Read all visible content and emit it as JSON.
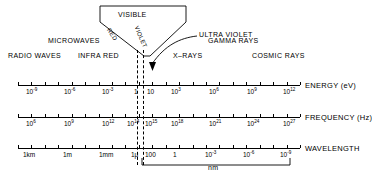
{
  "figure": {
    "visible_funnel": {
      "label": "VISIBLE",
      "left_edge_label": "RED",
      "right_edge_label": "VIOLET"
    },
    "callout": {
      "label": "ULTRA VIOLET",
      "arrow": "curved-arrow-down"
    },
    "bands_upper": [
      {
        "label": "MICROWAVES",
        "x": 87,
        "y": 40
      },
      {
        "label": "GAMMA RAYS",
        "x": 244,
        "y": 40
      }
    ],
    "bands_lower": [
      {
        "label": "RADIO WAVES",
        "x": 35,
        "y": 56
      },
      {
        "label": "INFRA RED",
        "x": 103,
        "y": 56
      },
      {
        "label": "X–RAYS",
        "x": 190,
        "y": 56
      },
      {
        "label": "COSMIC RAYS",
        "x": 280,
        "y": 56
      }
    ],
    "bracket": {
      "label": "nm",
      "from_x": 142,
      "to_x": 290
    },
    "dashed_lines_x": [
      137,
      143
    ],
    "axes": [
      {
        "name": "ENERGY  (eV)",
        "short": "energy",
        "y": 85,
        "x_start": 18,
        "x_end": 300,
        "tick_count": 22,
        "labels": [
          {
            "text": "10",
            "sup": "-9",
            "x": 26
          },
          {
            "text": "10",
            "sup": "-6",
            "x": 64
          },
          {
            "text": "10",
            "sup": "-3",
            "x": 102
          },
          {
            "text": "1",
            "sup": "",
            "x": 134
          },
          {
            "text": "10",
            "sup": "",
            "x": 147
          },
          {
            "text": "10",
            "sup": "3",
            "x": 171
          },
          {
            "text": "10",
            "sup": "6",
            "x": 209
          },
          {
            "text": "10",
            "sup": "9",
            "x": 247
          },
          {
            "text": "10",
            "sup": "12",
            "x": 283
          }
        ]
      },
      {
        "name": "FREQUENCY (Hz)",
        "short": "frequency",
        "y": 117,
        "x_start": 18,
        "x_end": 300,
        "tick_count": 22,
        "labels": [
          {
            "text": "10",
            "sup": "6",
            "x": 26
          },
          {
            "text": "10",
            "sup": "9",
            "x": 64
          },
          {
            "text": "10",
            "sup": "12",
            "x": 102
          },
          {
            "text": "10",
            "sup": "14",
            "x": 127
          },
          {
            "text": "10",
            "sup": "15",
            "x": 145
          },
          {
            "text": "10",
            "sup": "18",
            "x": 171
          },
          {
            "text": "10",
            "sup": "21",
            "x": 209
          },
          {
            "text": "10",
            "sup": "24",
            "x": 247
          },
          {
            "text": "10",
            "sup": "27",
            "x": 283
          }
        ]
      },
      {
        "name": "WAVELENGTH",
        "short": "wavelength",
        "y": 148,
        "x_start": 18,
        "x_end": 300,
        "tick_count": 22,
        "labels": [
          {
            "text": "1km",
            "sup": "",
            "x": 23
          },
          {
            "text": "1m",
            "sup": "",
            "x": 63
          },
          {
            "text": "1mm",
            "sup": "",
            "x": 99
          },
          {
            "text": "1μ",
            "sup": "",
            "x": 131
          },
          {
            "text": "100",
            "sup": "",
            "x": 145
          },
          {
            "text": "1",
            "sup": "",
            "x": 173
          },
          {
            "text": "10",
            "sup": "-3",
            "x": 205
          },
          {
            "text": "10",
            "sup": "-6",
            "x": 243
          },
          {
            "text": "10",
            "sup": "-9",
            "x": 280
          }
        ]
      }
    ]
  },
  "chart_data": {
    "type": "diagram",
    "scales": [
      {
        "name": "ENERGY  (eV)",
        "ticks": [
          "10^-9",
          "10^-6",
          "10^-3",
          "1",
          "10",
          "10^3",
          "10^6",
          "10^9",
          "10^12"
        ]
      },
      {
        "name": "FREQUENCY (Hz)",
        "ticks": [
          "10^6",
          "10^9",
          "10^12",
          "10^14",
          "10^15",
          "10^18",
          "10^21",
          "10^24",
          "10^27"
        ]
      },
      {
        "name": "WAVELENGTH",
        "ticks": [
          "1km",
          "1m",
          "1mm",
          "1μ",
          "100",
          "1",
          "10^-3",
          "10^-6",
          "10^-9"
        ]
      }
    ],
    "bands": [
      "RADIO WAVES",
      "MICROWAVES",
      "INFRA RED",
      "VISIBLE",
      "ULTRA VIOLET",
      "X–RAYS",
      "GAMMA RAYS",
      "COSMIC RAYS"
    ],
    "visible_sub_bands": [
      "RED",
      "VIOLET"
    ],
    "bracket_units": "nm"
  }
}
